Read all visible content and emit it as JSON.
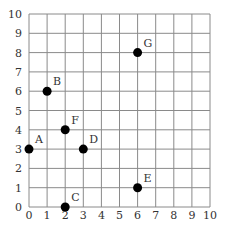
{
  "chart_data": {
    "type": "scatter",
    "title": "",
    "xlabel": "",
    "ylabel": "",
    "xlim": [
      0,
      10
    ],
    "ylim": [
      0,
      10
    ],
    "grid": true,
    "x_ticks": [
      "0",
      "1",
      "2",
      "3",
      "4",
      "5",
      "6",
      "7",
      "8",
      "9",
      "10"
    ],
    "y_ticks": [
      "0",
      "1",
      "2",
      "3",
      "4",
      "5",
      "6",
      "7",
      "8",
      "9",
      "10"
    ],
    "points": [
      {
        "label": "A",
        "x": 0,
        "y": 3
      },
      {
        "label": "B",
        "x": 1,
        "y": 6
      },
      {
        "label": "C",
        "x": 2,
        "y": 0
      },
      {
        "label": "D",
        "x": 3,
        "y": 3
      },
      {
        "label": "E",
        "x": 6,
        "y": 1
      },
      {
        "label": "F",
        "x": 2,
        "y": 4
      },
      {
        "label": "G",
        "x": 6,
        "y": 8
      }
    ]
  },
  "colors": {
    "grid": "#8a8a8a",
    "axis": "#555555",
    "point": "#000000",
    "text": "#333333"
  }
}
